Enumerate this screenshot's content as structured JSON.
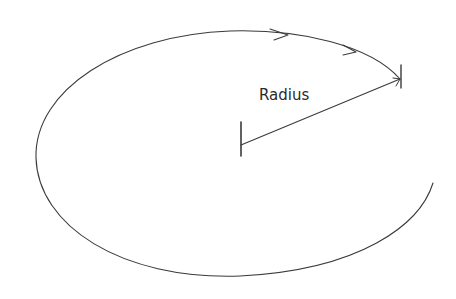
{
  "diagram": {
    "title": "",
    "labels": {
      "radius": "Radius"
    },
    "elements": [
      {
        "name": "orbit-curve",
        "kind": "open elliptical spiral path",
        "direction": "clockwise"
      },
      {
        "name": "radius-line",
        "kind": "line from center to orbit"
      },
      {
        "name": "center-tick",
        "kind": "tick mark"
      },
      {
        "name": "end-tick",
        "kind": "tick mark"
      },
      {
        "name": "direction-arrow",
        "count": 2
      }
    ],
    "colors": {
      "stroke": "#3a3a3a",
      "text": "#2a2a2a",
      "background": "#ffffff"
    }
  }
}
